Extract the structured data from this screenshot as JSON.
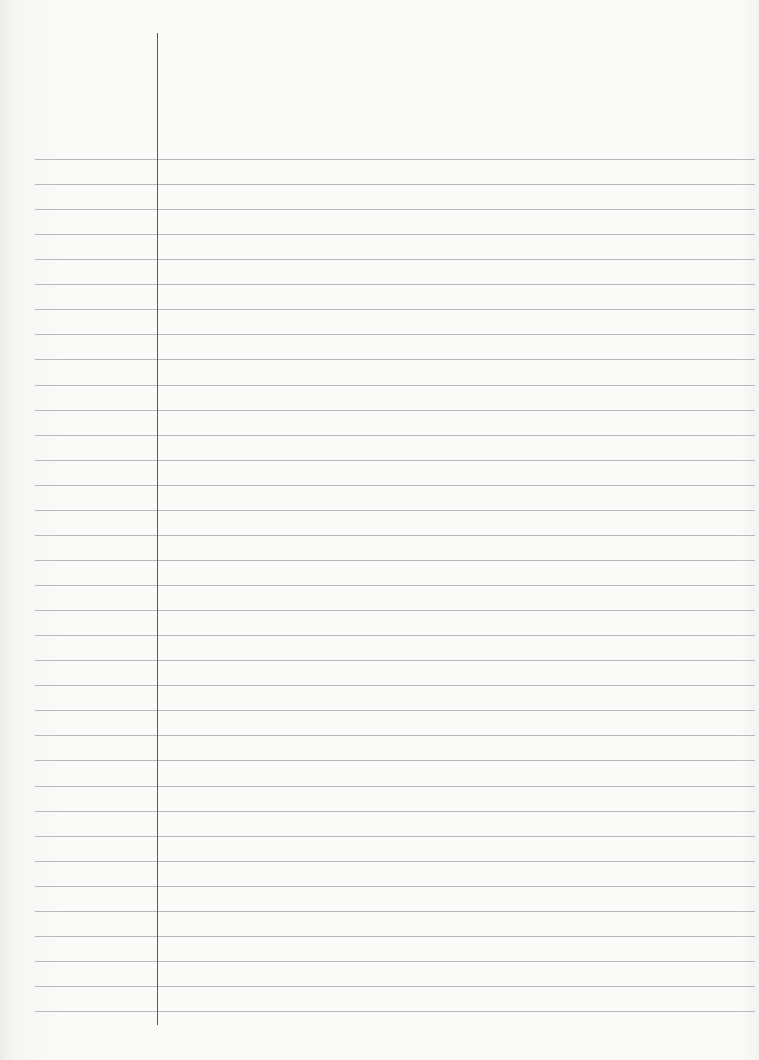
{
  "page": {
    "type": "lined notebook paper",
    "ruled_lines": {
      "count": 35,
      "first_y": 159,
      "spacing": 25.06,
      "left_x": 35,
      "right_x": 755,
      "color": "#b9b9b9"
    },
    "margin_line": {
      "x": 157,
      "top_y": 33,
      "bottom_y": 1025,
      "color": "#5a5a5a"
    },
    "background_color": "#fafaf9",
    "text_content": []
  }
}
